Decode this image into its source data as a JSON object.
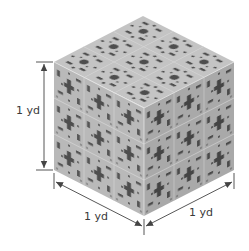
{
  "diagram": {
    "colors": {
      "top_face": "#c4c4c4",
      "left_face": "#b9b9b9",
      "right_face": "#a9a9a9",
      "holes": "#4e4e4e",
      "seams": "#d6d6d6",
      "dimension_lines": "#444444",
      "label_text": "#3a3a3a"
    },
    "grid_divisions": 3,
    "dimensions": {
      "height": {
        "label": "1 yd"
      },
      "depth_left": {
        "label": "1 yd"
      },
      "width_right": {
        "label": "1 yd"
      }
    }
  }
}
